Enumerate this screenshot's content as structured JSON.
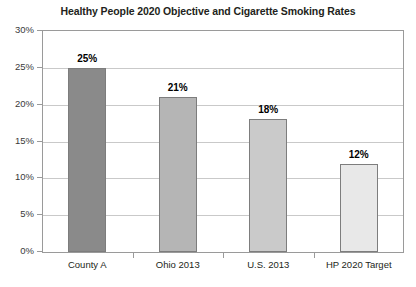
{
  "chart_data": {
    "type": "bar",
    "title": "Healthy People 2020 Objective and Cigarette Smoking Rates",
    "xlabel": "",
    "ylabel": "",
    "ylim": [
      0,
      30
    ],
    "ytick_step": 5,
    "grid": true,
    "legend": "none",
    "categories": [
      "County A",
      "Ohio 2013",
      "U.S. 2013",
      "HP 2020 Target"
    ],
    "values": [
      25,
      21,
      18,
      12
    ],
    "value_labels": [
      "25%",
      "21%",
      "18%",
      "12%"
    ],
    "ytick_labels": [
      "0%",
      "5%",
      "10%",
      "15%",
      "20%",
      "25%",
      "30%"
    ],
    "bar_colors": [
      "#8a8a8a",
      "#b5b5b5",
      "#cacaca",
      "#e8e8e8"
    ],
    "bar_border_color": "#7d7d7d",
    "gridline_color": "#c9c9c9",
    "axis_color": "#9a9a9a",
    "background_color": "#ffffff",
    "text_color": "#231f20"
  }
}
